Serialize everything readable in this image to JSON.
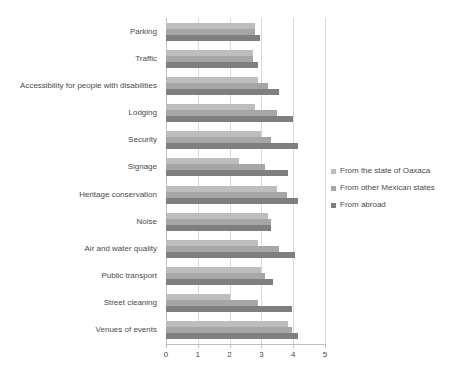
{
  "chart_data": {
    "type": "bar",
    "orientation": "horizontal",
    "title": "",
    "xlabel": "",
    "ylabel": "",
    "xlim": [
      0,
      5
    ],
    "xticks": [
      0,
      1,
      2,
      3,
      4,
      5
    ],
    "xtick_labels": [
      "0",
      "1",
      "2",
      "3",
      "4",
      "5"
    ],
    "grid": true,
    "legend_position": "right",
    "categories": [
      "Parking",
      "Traffic",
      "Accessibility for people with disabilities",
      "Lodging",
      "Security",
      "Signage",
      "Heritage conservation",
      "Noise",
      "Air and water quality",
      "Public transport",
      "Street cleaning",
      "Venues of events"
    ],
    "series": [
      {
        "name": "From the state of Oaxaca",
        "color": "#bdbdbd",
        "values": [
          2.8,
          2.75,
          2.9,
          2.8,
          3.0,
          2.3,
          3.5,
          3.2,
          2.9,
          3.0,
          2.0,
          3.85
        ]
      },
      {
        "name": "From other Mexican states",
        "color": "#a6a6a6",
        "values": [
          2.8,
          2.75,
          3.2,
          3.5,
          3.3,
          3.1,
          3.8,
          3.3,
          3.55,
          3.1,
          2.9,
          3.95
        ]
      },
      {
        "name": "From abroad",
        "color": "#7f7f7f",
        "values": [
          2.95,
          2.9,
          3.55,
          4.0,
          4.15,
          3.85,
          4.15,
          3.3,
          4.05,
          3.35,
          3.95,
          4.15
        ]
      }
    ]
  }
}
